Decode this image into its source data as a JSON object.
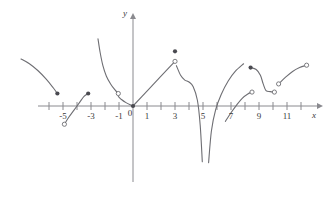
{
  "figure": {
    "title": "",
    "background_color": "#ffffff",
    "curve_color": "#6e6e73",
    "axis_color": "#8a8a8f",
    "label_color": "#3a3a3a",
    "width": 336,
    "height": 200
  },
  "axes": {
    "x_axis_label": "x",
    "y_axis_label": "y",
    "origin_label": "0",
    "x_tick_labels": [
      "-5",
      "-3",
      "-1",
      "1",
      "3",
      "5",
      "7",
      "9",
      "11"
    ],
    "x_tick_values": [
      -5,
      -3,
      -1,
      1,
      3,
      5,
      7,
      9,
      11
    ],
    "x_ticks_all": [
      -6,
      -5,
      -4,
      -3,
      -2,
      -1,
      1,
      2,
      3,
      4,
      5,
      6,
      7,
      8,
      9,
      10,
      11,
      12
    ],
    "x_range": [
      -7,
      12.8
    ],
    "y_range": [
      -6.2,
      7.2
    ],
    "x_arrow": true,
    "y_arrow": true,
    "grid": false
  },
  "chart_data": {
    "type": "line",
    "title": "",
    "xlabel": "x",
    "ylabel": "y",
    "xlim": [
      -7,
      12.8
    ],
    "ylim": [
      -6.2,
      7.2
    ],
    "grid": false,
    "legend": "none",
    "segments": [
      {
        "name": "far-left-decreasing-arc",
        "points": [
          [
            -8.0,
            4.9
          ],
          [
            -7.4,
            4.4
          ],
          [
            -6.8,
            3.7
          ],
          [
            -6.2,
            2.8
          ],
          [
            -5.7,
            1.9
          ],
          [
            -5.4,
            1.3
          ]
        ],
        "start_marker": "none",
        "end_marker": "closed"
      },
      {
        "name": "second-increasing-arc",
        "points": [
          [
            -4.9,
            -1.9
          ],
          [
            -4.6,
            -1.2
          ],
          [
            -4.2,
            -0.4
          ],
          [
            -3.8,
            0.4
          ],
          [
            -3.5,
            1.0
          ],
          [
            -3.2,
            1.3
          ]
        ],
        "start_marker": "open",
        "end_marker": "closed"
      },
      {
        "name": "decreasing-branch-to-origin",
        "points": [
          [
            -2.5,
            7.0
          ],
          [
            -2.35,
            5.6
          ],
          [
            -2.15,
            4.2
          ],
          [
            -1.9,
            3.1
          ],
          [
            -1.6,
            2.3
          ],
          [
            -1.3,
            1.7
          ],
          [
            -1.05,
            1.3
          ]
        ],
        "start_marker": "none",
        "end_marker": "open"
      },
      {
        "name": "short-drop-to-origin",
        "points": [
          [
            -1.05,
            1.0
          ],
          [
            -0.8,
            0.65
          ],
          [
            -0.5,
            0.35
          ],
          [
            -0.2,
            0.12
          ],
          [
            0,
            0
          ]
        ],
        "start_marker": "none",
        "end_marker": "closed"
      },
      {
        "name": "rising-line-origin-to-three",
        "points": [
          [
            0,
            0
          ],
          [
            1,
            1.55
          ],
          [
            2,
            3.1
          ],
          [
            3,
            4.65
          ]
        ],
        "start_marker": "closed",
        "end_marker": "open"
      },
      {
        "name": "descending-to-asymptote",
        "points": [
          [
            3.1,
            4.2
          ],
          [
            3.4,
            3.2
          ],
          [
            3.7,
            2.7
          ],
          [
            4.0,
            2.5
          ],
          [
            4.3,
            2.0
          ],
          [
            4.6,
            0.6
          ],
          [
            4.8,
            -2.0
          ],
          [
            4.95,
            -5.8
          ]
        ],
        "start_marker": "none",
        "end_marker": "none"
      },
      {
        "name": "right-of-asymptote-rising",
        "points": [
          [
            5.4,
            -5.9
          ],
          [
            5.6,
            -2.6
          ],
          [
            5.9,
            -0.4
          ],
          [
            6.3,
            1.2
          ],
          [
            6.8,
            2.6
          ],
          [
            7.3,
            3.6
          ],
          [
            7.9,
            4.4
          ]
        ],
        "start_marker": "none",
        "end_marker": "none"
      },
      {
        "name": "concave-arc-to-eight",
        "points": [
          [
            6.6,
            -1.6
          ],
          [
            7.0,
            -0.7
          ],
          [
            7.4,
            0.1
          ],
          [
            7.8,
            0.8
          ],
          [
            8.2,
            1.25
          ],
          [
            8.5,
            1.45
          ]
        ],
        "start_marker": "none",
        "end_marker": "open"
      },
      {
        "name": "s-curve-from-nine",
        "points": [
          [
            8.4,
            4.0
          ],
          [
            8.8,
            3.8
          ],
          [
            9.1,
            3.2
          ],
          [
            9.3,
            2.3
          ],
          [
            9.5,
            1.6
          ],
          [
            9.8,
            1.5
          ],
          [
            10.1,
            1.45
          ]
        ],
        "start_marker": "closed",
        "end_marker": "open"
      },
      {
        "name": "right-rising-arc",
        "points": [
          [
            10.4,
            2.3
          ],
          [
            10.9,
            3.0
          ],
          [
            11.4,
            3.6
          ],
          [
            11.9,
            4.0
          ],
          [
            12.4,
            4.25
          ]
        ],
        "start_marker": "open",
        "end_marker": "open"
      }
    ],
    "closed_points": [
      {
        "name": "closed-point-left-arc-end",
        "x": -5.4,
        "y": 1.3
      },
      {
        "name": "closed-point-second-arc-end",
        "x": -3.2,
        "y": 1.3
      },
      {
        "name": "closed-point-origin",
        "x": 0,
        "y": 0
      },
      {
        "name": "closed-point-above-three",
        "x": 3,
        "y": 5.7
      },
      {
        "name": "closed-point-at-nine",
        "x": 8.4,
        "y": 4.0
      }
    ],
    "open_points": [
      {
        "name": "open-point-second-arc-start",
        "x": -4.9,
        "y": -1.9
      },
      {
        "name": "open-point-left-of-origin",
        "x": -1.05,
        "y": 1.3
      },
      {
        "name": "open-point-at-three",
        "x": 3,
        "y": 4.65
      },
      {
        "name": "open-point-at-eight",
        "x": 8.5,
        "y": 1.45
      },
      {
        "name": "open-point-s-curve-end",
        "x": 10.1,
        "y": 1.45
      },
      {
        "name": "open-point-right-arc-start",
        "x": 10.4,
        "y": 2.3
      },
      {
        "name": "open-point-right-arc-end",
        "x": 12.4,
        "y": 4.25
      }
    ],
    "asymptotes": [
      {
        "name": "vertical-asymptote",
        "x": 5,
        "type": "vertical"
      }
    ]
  }
}
